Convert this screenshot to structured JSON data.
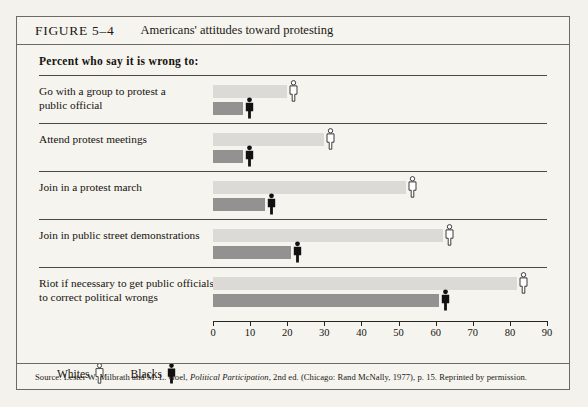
{
  "figure": {
    "number_label": "FIGURE 5–4",
    "title": "Americans' attitudes toward protesting",
    "subhead": "Percent who say it is wrong to:",
    "source_prefix": "Source: Lester W. Milbrath and M. L. Goel, ",
    "source_italic": "Political Participation",
    "source_suffix": ", 2nd ed. (Chicago: Rand McNally, 1977), p. 15. Reprinted by permission."
  },
  "legend": {
    "items": [
      {
        "label": "Whites",
        "icon": "person-icon-white",
        "color": "#ffffff"
      },
      {
        "label": "Blacks",
        "icon": "person-icon-black",
        "color": "#111111"
      }
    ]
  },
  "chart_data": {
    "type": "bar",
    "orientation": "horizontal",
    "title": "Americans' attitudes toward protesting",
    "subtitle": "Percent who say it is wrong to:",
    "xlabel": "",
    "ylabel": "",
    "xlim": [
      0,
      90
    ],
    "xticks": [
      0,
      10,
      20,
      30,
      40,
      50,
      60,
      70,
      80,
      90
    ],
    "xticklabels": [
      "0",
      "10",
      "20",
      "30",
      "40",
      "50",
      "60",
      "70",
      "80",
      "90"
    ],
    "grid": false,
    "legend_position": "bottom-left",
    "categories": [
      "Go with a group to protest a public official",
      "Attend protest meetings",
      "Join in a protest march",
      "Join in public street demonstrations",
      "Riot if necessary to get public officials to correct political wrongs"
    ],
    "category_lines": [
      [
        "Go with a group to protest a",
        "public official"
      ],
      [
        "Attend protest meetings"
      ],
      [
        "Join in a protest march"
      ],
      [
        "Join in public street demonstrations"
      ],
      [
        "Riot if necessary to get public officials",
        "to correct political wrongs"
      ]
    ],
    "series": [
      {
        "name": "Whites",
        "color": "#dcdad6",
        "marker": "person-icon-white",
        "values": [
          20,
          30,
          52,
          62,
          82
        ]
      },
      {
        "name": "Blacks",
        "color": "#929290",
        "marker": "person-icon-black",
        "values": [
          8,
          8,
          14,
          21,
          61
        ]
      }
    ]
  },
  "colors": {
    "whites_bar": "#dcdad6",
    "blacks_bar": "#929290",
    "axis": "#26251f",
    "rule": "#4a4945",
    "page_background": "#f4f2ed",
    "figure_background": "#f6f4ef"
  }
}
